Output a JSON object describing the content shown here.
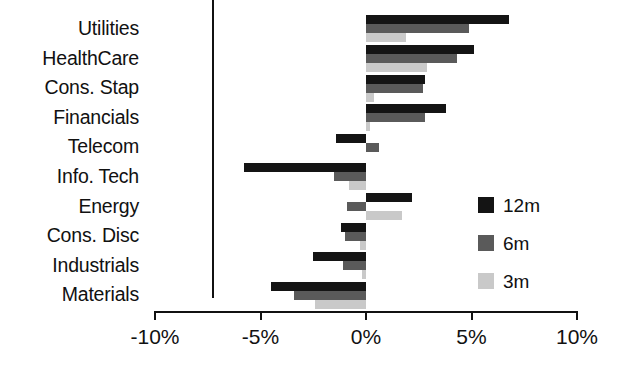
{
  "chart_data": {
    "type": "bar",
    "orientation": "horizontal",
    "title": "",
    "xlabel": "",
    "ylabel": "",
    "xlim": [
      -10,
      10
    ],
    "grid": false,
    "legend_position": "right-middle",
    "tick_labels": [
      "-10%",
      "-5%",
      "0%",
      "5%",
      "10%"
    ],
    "tick_values": [
      -10,
      -5,
      0,
      5,
      10
    ],
    "categories": [
      "Utilities",
      "HealthCare",
      "Cons. Stap",
      "Financials",
      "Telecom",
      "Info. Tech",
      "Energy",
      "Cons. Disc",
      "Industrials",
      "Materials"
    ],
    "series": [
      {
        "name": "12m",
        "color": "#141414",
        "values": [
          6.8,
          5.1,
          2.8,
          3.8,
          -1.4,
          -5.8,
          2.2,
          -1.2,
          -2.5,
          -4.5
        ]
      },
      {
        "name": "6m",
        "color": "#5a5a5a",
        "values": [
          4.9,
          4.3,
          2.7,
          2.8,
          0.6,
          -1.5,
          -0.9,
          -1.0,
          -1.1,
          -3.4
        ]
      },
      {
        "name": "3m",
        "color": "#c9c9c9",
        "values": [
          1.9,
          2.9,
          0.4,
          0.2,
          0.0,
          -0.8,
          1.7,
          -0.3,
          -0.2,
          -2.4
        ]
      }
    ]
  }
}
